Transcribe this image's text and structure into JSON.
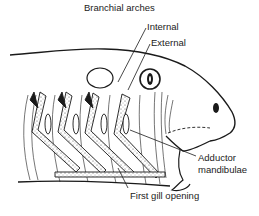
{
  "diagram": {
    "title": "Branchial arches",
    "labels": {
      "internal": "Internal",
      "external": "External",
      "adductor_line1": "Adductor",
      "adductor_line2": "mandibulae",
      "first_gill_opening": "First gill opening"
    },
    "colors": {
      "ink": "#1a1a1a",
      "background": "#ffffff",
      "stipple": "#555555"
    },
    "arch_count": 4
  }
}
